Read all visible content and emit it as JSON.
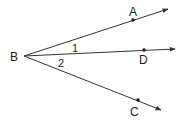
{
  "diagram": {
    "type": "geometry-angles",
    "vertex": {
      "label": "B",
      "x": 24,
      "y": 56
    },
    "rays": [
      {
        "name": "BA",
        "end": [
          168,
          9
        ],
        "point": [
          133,
          20
        ],
        "point_label": "A",
        "label_pos": [
          129,
          16
        ]
      },
      {
        "name": "BD",
        "end": [
          175,
          49
        ],
        "point": [
          144,
          50
        ],
        "point_label": "D",
        "label_pos": [
          143,
          64
        ]
      },
      {
        "name": "BC",
        "end": [
          161,
          110
        ],
        "point": [
          138,
          100
        ],
        "point_label": "C",
        "label_pos": [
          134,
          116
        ]
      }
    ],
    "angle_labels": [
      {
        "label": "1",
        "x": 75,
        "y": 52
      },
      {
        "label": "2",
        "x": 61,
        "y": 67
      }
    ],
    "colors": {
      "line": "#333333",
      "text": "#222222"
    }
  }
}
